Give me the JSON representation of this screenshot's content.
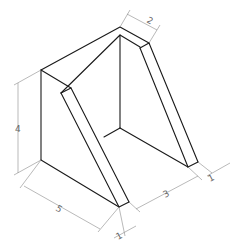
{
  "figure": {
    "type": "isometric-drawing"
  },
  "dimensions": {
    "height": "4",
    "depth": "5",
    "top_width": "2",
    "inner_width": "3",
    "right_wall": "1",
    "left_wall": "1"
  },
  "colors": {
    "object_line": "#1a1a1a",
    "dimension_line": "#8a8a8a",
    "label": "#666666"
  }
}
